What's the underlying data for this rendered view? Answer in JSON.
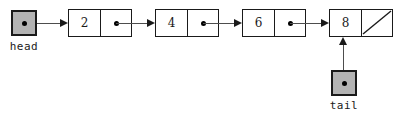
{
  "diagram": {
    "type": "singly-linked-list",
    "background_color": "#ffffff",
    "line_color": "#1a1a1a",
    "arrow_color": "#4d4d4d",
    "pointer_box_fill": "#b3b3b3",
    "node_fill": "#ffffff"
  },
  "pointers": [
    {
      "id": "head",
      "label": "head",
      "box_x": 11,
      "box_y": 10,
      "label_x": 0,
      "label_y": 40,
      "label_width": 48,
      "target": "node-0",
      "direction": "right"
    },
    {
      "id": "tail",
      "label": "tail",
      "box_x": 331,
      "box_y": 70,
      "label_x": 318,
      "label_y": 99,
      "label_width": 52,
      "target": "node-3",
      "direction": "up"
    }
  ],
  "nodes": [
    {
      "id": "node-0",
      "value": "2",
      "x": 68,
      "next_is_null": false,
      "next_label": "next-pointer-dot"
    },
    {
      "id": "node-1",
      "value": "4",
      "x": 155,
      "next_is_null": false,
      "next_label": "next-pointer-dot"
    },
    {
      "id": "node-2",
      "value": "6",
      "x": 242,
      "next_is_null": false,
      "next_label": "next-pointer-dot"
    },
    {
      "id": "node-3",
      "value": "8",
      "x": 329,
      "next_is_null": true,
      "next_label": "null-pointer-slash"
    }
  ],
  "connectors": [
    {
      "id": "head-to-node-0",
      "orientation": "horizontal",
      "x": 37,
      "y": 19,
      "length": 31
    },
    {
      "id": "node-0-to-node-1",
      "orientation": "horizontal",
      "x": 116,
      "y": 19,
      "length": 39
    },
    {
      "id": "node-1-to-node-2",
      "orientation": "horizontal",
      "x": 203,
      "y": 19,
      "length": 39
    },
    {
      "id": "node-2-to-node-3",
      "orientation": "horizontal",
      "x": 290,
      "y": 19,
      "length": 39
    },
    {
      "id": "tail-to-node-3",
      "orientation": "vertical",
      "x": 339,
      "y": 37,
      "length": 33
    }
  ]
}
